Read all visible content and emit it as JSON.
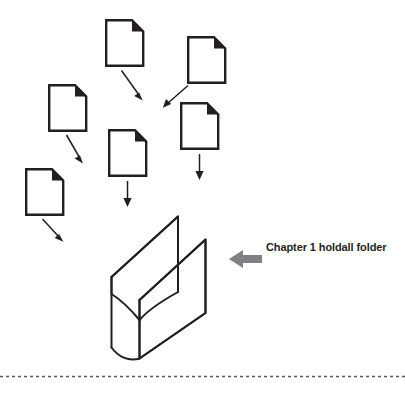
{
  "figure": {
    "type": "process-diagram",
    "canvas": {
      "width": 405,
      "height": 397
    },
    "colors": {
      "ink": "#231f20",
      "document_outline": "#231f20",
      "document_fill": "#ffffff",
      "callout_arrow": "#808184",
      "divider": "#58595b",
      "background": "#ffffff"
    },
    "callout": {
      "label": "Chapter 1 holdall folder",
      "arrow_direction": "left",
      "arrow_color": "#808184"
    },
    "documents": [
      {
        "id": "doc-top-center",
        "x": 105,
        "y": 19,
        "width": 38,
        "height": 47,
        "fold": "top-right"
      },
      {
        "id": "doc-top-right",
        "x": 187,
        "y": 36,
        "width": 38,
        "height": 47,
        "fold": "top-right"
      },
      {
        "id": "doc-left-upper",
        "x": 48,
        "y": 84,
        "width": 38,
        "height": 47,
        "fold": "top-right"
      },
      {
        "id": "doc-middle-right",
        "x": 180,
        "y": 102,
        "width": 38,
        "height": 47,
        "fold": "top-right"
      },
      {
        "id": "doc-center",
        "x": 108,
        "y": 129,
        "width": 38,
        "height": 47,
        "fold": "top-right"
      },
      {
        "id": "doc-left-lower",
        "x": 25,
        "y": 168,
        "width": 38,
        "height": 47,
        "fold": "top-right"
      }
    ],
    "flow_arrows": [
      {
        "id": "arrow-top-center-down-right",
        "from": "doc-top-center",
        "to": "holdall-folder"
      },
      {
        "id": "arrow-top-right-down-left",
        "from": "doc-top-right",
        "to": "holdall-folder"
      },
      {
        "id": "arrow-left-upper-down-right",
        "from": "doc-left-upper",
        "to": "holdall-folder"
      },
      {
        "id": "arrow-middle-right-down",
        "from": "doc-middle-right",
        "to": "holdall-folder"
      },
      {
        "id": "arrow-center-down",
        "from": "doc-center",
        "to": "holdall-folder"
      },
      {
        "id": "arrow-left-lower-down-right",
        "from": "doc-left-lower",
        "to": "holdall-folder"
      }
    ],
    "folder": {
      "id": "holdall-folder",
      "shape": "open-gusset-folder",
      "x": 105,
      "y": 215,
      "width": 115,
      "height": 145
    },
    "divider": {
      "style": "dashed",
      "y": 376
    }
  }
}
